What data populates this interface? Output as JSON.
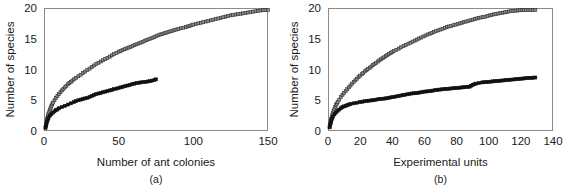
{
  "figure": {
    "background_color": "#ffffff",
    "frame_color": "#8a8a8a",
    "text_color": "#1a1a1a"
  },
  "chart_data": [
    {
      "type": "line",
      "panel": "a",
      "caption": "(a)",
      "title": "",
      "xlabel": "Number of ant colonies",
      "ylabel": "Number of species",
      "xlim": [
        0,
        150
      ],
      "ylim": [
        0,
        20
      ],
      "xticks": [
        0,
        50,
        100,
        150
      ],
      "yticks": [
        0,
        5,
        10,
        15,
        20
      ],
      "xtick_labels": [
        "0",
        "50",
        "100",
        "150"
      ],
      "ytick_labels": [
        "0",
        "5",
        "10",
        "15",
        "20"
      ],
      "grid": false,
      "legend": "none",
      "series": [
        {
          "name": "upper-accumulation-curve",
          "marker": "square",
          "marker_fill": "#8c8c8c",
          "marker_edge": "#2b2b2b",
          "line_color": "#3a3a3a",
          "x": [
            1,
            2,
            3,
            4,
            5,
            6,
            7,
            8,
            9,
            10,
            12,
            14,
            16,
            18,
            20,
            23,
            26,
            29,
            32,
            35,
            38,
            41,
            44,
            47,
            50,
            54,
            58,
            62,
            66,
            70,
            74,
            78,
            82,
            86,
            90,
            95,
            100,
            105,
            110,
            115,
            120,
            125,
            130,
            135,
            140,
            145,
            150
          ],
          "y": [
            0.6,
            1.9,
            2.8,
            3.5,
            4.1,
            4.6,
            5.0,
            5.4,
            5.7,
            6.0,
            6.6,
            7.1,
            7.6,
            8.0,
            8.4,
            8.9,
            9.4,
            9.9,
            10.4,
            10.9,
            11.3,
            11.7,
            12.1,
            12.5,
            12.9,
            13.3,
            13.7,
            14.1,
            14.5,
            14.9,
            15.3,
            15.7,
            16.0,
            16.3,
            16.6,
            16.9,
            17.3,
            17.6,
            17.9,
            18.2,
            18.5,
            18.8,
            19.0,
            19.2,
            19.4,
            19.6,
            19.7
          ]
        },
        {
          "name": "lower-accumulation-curve",
          "marker": "square",
          "marker_fill": "#111111",
          "marker_edge": "#111111",
          "line_color": "#111111",
          "x": [
            1,
            2,
            3,
            4,
            5,
            6,
            7,
            8,
            9,
            10,
            12,
            14,
            16,
            18,
            20,
            23,
            26,
            29,
            32,
            35,
            38,
            41,
            44,
            47,
            50,
            53,
            56,
            59,
            62,
            65,
            68,
            71,
            74,
            75
          ],
          "y": [
            0.5,
            1.5,
            2.1,
            2.5,
            2.8,
            3.0,
            3.2,
            3.4,
            3.5,
            3.7,
            3.9,
            4.1,
            4.3,
            4.5,
            4.7,
            5.0,
            5.2,
            5.4,
            5.7,
            6.0,
            6.2,
            6.4,
            6.6,
            6.8,
            7.0,
            7.2,
            7.4,
            7.6,
            7.8,
            7.9,
            8.0,
            8.1,
            8.3,
            8.4
          ]
        }
      ]
    },
    {
      "type": "line",
      "panel": "b",
      "caption": "(b)",
      "title": "",
      "xlabel": "Experimental units",
      "ylabel": "Number of species",
      "xlim": [
        0,
        140
      ],
      "ylim": [
        0,
        20
      ],
      "xticks": [
        0,
        20,
        40,
        60,
        80,
        100,
        120,
        140
      ],
      "yticks": [
        0,
        5,
        10,
        15,
        20
      ],
      "xtick_labels": [
        "0",
        "20",
        "40",
        "60",
        "80",
        "100",
        "120",
        "140"
      ],
      "ytick_labels": [
        "0",
        "5",
        "10",
        "15",
        "20"
      ],
      "grid": false,
      "legend": "none",
      "series": [
        {
          "name": "upper-accumulation-curve",
          "marker": "square",
          "marker_fill": "#8c8c8c",
          "marker_edge": "#2b2b2b",
          "line_color": "#3a3a3a",
          "x": [
            1,
            2,
            3,
            4,
            5,
            6,
            7,
            8,
            9,
            10,
            12,
            14,
            16,
            18,
            20,
            23,
            26,
            29,
            32,
            35,
            38,
            41,
            44,
            47,
            50,
            54,
            58,
            62,
            66,
            70,
            74,
            78,
            82,
            86,
            90,
            94,
            98,
            102,
            106,
            110,
            114,
            118,
            122,
            126,
            129
          ],
          "y": [
            0.7,
            2.0,
            2.9,
            3.6,
            4.2,
            4.7,
            5.1,
            5.5,
            5.9,
            6.2,
            6.8,
            7.4,
            8.0,
            8.5,
            9.0,
            9.7,
            10.3,
            10.9,
            11.5,
            12.0,
            12.5,
            13.0,
            13.4,
            13.8,
            14.2,
            14.7,
            15.2,
            15.7,
            16.1,
            16.5,
            16.9,
            17.2,
            17.5,
            17.8,
            18.1,
            18.4,
            18.6,
            18.9,
            19.1,
            19.3,
            19.5,
            19.6,
            19.7,
            19.7,
            19.7
          ]
        },
        {
          "name": "lower-accumulation-curve",
          "marker": "square",
          "marker_fill": "#111111",
          "marker_edge": "#111111",
          "line_color": "#111111",
          "x": [
            1,
            2,
            3,
            4,
            5,
            6,
            7,
            8,
            9,
            10,
            12,
            14,
            16,
            18,
            20,
            24,
            28,
            32,
            36,
            40,
            44,
            48,
            52,
            56,
            60,
            64,
            68,
            72,
            76,
            80,
            84,
            88,
            90,
            92,
            94,
            96,
            100,
            104,
            108,
            112,
            116,
            120,
            124,
            129
          ],
          "y": [
            0.6,
            1.6,
            2.3,
            2.7,
            3.0,
            3.3,
            3.5,
            3.7,
            3.9,
            4.0,
            4.2,
            4.4,
            4.5,
            4.6,
            4.7,
            4.9,
            5.0,
            5.2,
            5.3,
            5.5,
            5.7,
            5.9,
            6.1,
            6.2,
            6.4,
            6.5,
            6.7,
            6.8,
            6.9,
            7.0,
            7.1,
            7.2,
            7.5,
            7.7,
            7.8,
            7.9,
            8.0,
            8.1,
            8.2,
            8.3,
            8.4,
            8.5,
            8.6,
            8.7
          ]
        }
      ]
    }
  ]
}
